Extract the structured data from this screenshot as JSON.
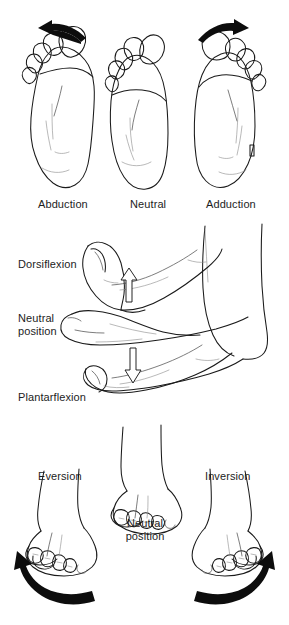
{
  "figure": {
    "background_color": "#ffffff",
    "ink_color": "#1a1a1a",
    "arrow_color": "#0d0d0d"
  },
  "panels": [
    {
      "id": "transverse",
      "plane": "transverse",
      "view": "plantar (sole) view",
      "items": [
        {
          "label": "Abduction",
          "arrow": "curved-arrow-left",
          "arrow_direction": "outward / lateral"
        },
        {
          "label": "Neutral",
          "arrow": "none",
          "arrow_direction": "none"
        },
        {
          "label": "Adduction",
          "arrow": "curved-arrow-right",
          "arrow_direction": "inward / medial"
        }
      ]
    },
    {
      "id": "sagittal",
      "plane": "sagittal",
      "view": "lateral (side) view",
      "items": [
        {
          "label": "Dorsiflexion",
          "arrow": "block-arrow-up",
          "arrow_direction": "upward"
        },
        {
          "label": "Neutral\nposition",
          "arrow": "none",
          "arrow_direction": "none"
        },
        {
          "label": "Plantarflexion",
          "arrow": "block-arrow-down",
          "arrow_direction": "downward"
        }
      ]
    },
    {
      "id": "frontal",
      "plane": "frontal",
      "view": "anterior (front) view",
      "items": [
        {
          "label": "Eversion",
          "arrow": "curved-arrow-left",
          "arrow_direction": "sole turns outward"
        },
        {
          "label": "Neutral\nposition",
          "arrow": "none",
          "arrow_direction": "none"
        },
        {
          "label": "Inversion",
          "arrow": "curved-arrow-right",
          "arrow_direction": "sole turns inward"
        }
      ]
    }
  ]
}
